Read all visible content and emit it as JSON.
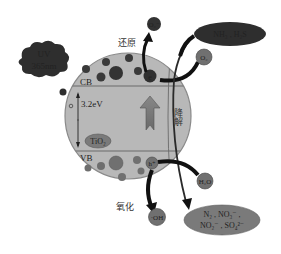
{
  "diagram": {
    "light_source": {
      "line1": "UV",
      "line2": "365nm"
    },
    "particle": {
      "label": "TiO₂",
      "conduction_band": "CB",
      "valence_band": "VB",
      "band_gap": "3.2eV",
      "degradation_label": "降解"
    },
    "electron": {
      "symbol": "e"
    },
    "hole": {
      "symbol": "h⁺"
    },
    "reduction": {
      "label": "还原",
      "reactant": "O₂",
      "product": "O₂⁻"
    },
    "oxidation": {
      "label": "氧化",
      "reactant": "H₂O",
      "product": "·OH"
    },
    "pollutants": {
      "text": "NH₃ , H₂S"
    },
    "products": {
      "line1": "N₂ , NO₃⁻ ,",
      "line2": "NO₂⁻ , SO₄²⁻"
    },
    "colors": {
      "particle_fill": "#b4b4b4",
      "particle_stroke": "#8a8a8a",
      "dark_bubble": "#3a3a3a",
      "mid_bubble": "#707070",
      "arrow_black": "#111111",
      "up_arrow": "#7a7a7a"
    }
  }
}
